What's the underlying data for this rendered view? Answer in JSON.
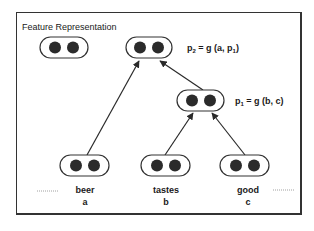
{
  "title": "Feature Representation",
  "equations": {
    "p2": {
      "lhs": "p",
      "lhs_sub": "2",
      "rhs_pre": " = g (a, p",
      "rhs_sub": "1",
      "rhs_post": ")"
    },
    "p1": {
      "lhs": "p",
      "lhs_sub": "1",
      "rhs_pre": " = g (b, c)",
      "rhs_sub": "",
      "rhs_post": ""
    }
  },
  "nodes": [
    {
      "id": "unattached",
      "label": "",
      "dots": 2
    },
    {
      "id": "p2",
      "label": "p2",
      "dots": 2
    },
    {
      "id": "p1",
      "label": "p1",
      "dots": 2
    },
    {
      "id": "a",
      "label": "a",
      "dots": 2
    },
    {
      "id": "b",
      "label": "b",
      "dots": 2
    },
    {
      "id": "c",
      "label": "c",
      "dots": 2
    }
  ],
  "edges": [
    {
      "from": "a",
      "to": "p2"
    },
    {
      "from": "p1",
      "to": "p2"
    },
    {
      "from": "b",
      "to": "p1"
    },
    {
      "from": "c",
      "to": "p1"
    }
  ],
  "words": [
    {
      "word": "beer",
      "var": "a"
    },
    {
      "word": "tastes",
      "var": "b"
    },
    {
      "word": "good",
      "var": "c"
    }
  ],
  "ellipsis_left": "",
  "ellipsis_right": ""
}
